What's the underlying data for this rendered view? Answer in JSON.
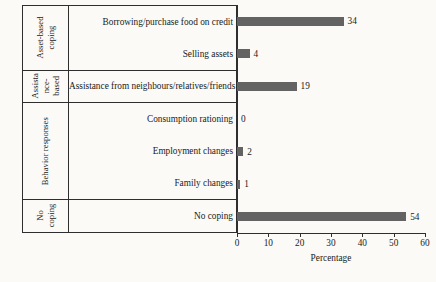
{
  "chart_data": {
    "type": "bar",
    "orientation": "horizontal",
    "title": "",
    "xlabel": "Percentage",
    "ylabel": "",
    "xlim": [
      0,
      60
    ],
    "xticks": [
      0,
      10,
      20,
      30,
      40,
      50,
      60
    ],
    "grid": false,
    "legend": null,
    "bar_color": "#636363",
    "categories": [
      "Borrowing/purchase food on credit",
      "Selling assets",
      "Assistance from neighbours/relatives/friends",
      "Consumption rationing",
      "Employment changes",
      "Family changes",
      "No coping"
    ],
    "values": [
      34,
      4,
      19,
      0,
      2,
      1,
      54
    ],
    "value_labels": [
      "34",
      "4",
      "19",
      "0",
      "2",
      "1",
      "54"
    ],
    "groups": [
      {
        "name": "Asset-based coping",
        "name_lines": [
          "Asset-based",
          "coping"
        ],
        "categories": [
          "Borrowing/purchase food on credit",
          "Selling assets"
        ],
        "values": [
          34,
          4
        ]
      },
      {
        "name": "Assistance-based",
        "name_lines": [
          "Assista",
          "nce-",
          "based"
        ],
        "categories": [
          "Assistance from neighbours/relatives/friends"
        ],
        "values": [
          19
        ]
      },
      {
        "name": "Behavior responses",
        "name_lines": [
          "Behavior responses"
        ],
        "categories": [
          "Consumption rationing",
          "Employment changes",
          "Family changes"
        ],
        "values": [
          0,
          2,
          1
        ]
      },
      {
        "name": "No coping",
        "name_lines": [
          "No",
          "coping"
        ],
        "categories": [
          "No coping"
        ],
        "values": [
          54
        ]
      }
    ]
  },
  "axis": {
    "ticks": [
      {
        "value": 0,
        "label": "0"
      },
      {
        "value": 10,
        "label": "10"
      },
      {
        "value": 20,
        "label": "20"
      },
      {
        "value": 30,
        "label": "30"
      },
      {
        "value": 40,
        "label": "40"
      },
      {
        "value": 50,
        "label": "50"
      },
      {
        "value": 60,
        "label": "60"
      }
    ],
    "title": "Percentage"
  },
  "groups": [
    {
      "lines": [
        "Asset-based",
        "coping"
      ],
      "rows": [
        {
          "label": "Borrowing/purchase food on credit",
          "value": 34,
          "value_label": "34"
        },
        {
          "label": "Selling assets",
          "value": 4,
          "value_label": "4"
        }
      ]
    },
    {
      "lines": [
        "Assista",
        "nce-",
        "based"
      ],
      "rows": [
        {
          "label": "Assistance from neighbours/relatives/friends",
          "value": 19,
          "value_label": "19"
        }
      ]
    },
    {
      "lines": [
        "Behavior responses"
      ],
      "rows": [
        {
          "label": "Consumption rationing",
          "value": 0,
          "value_label": "0"
        },
        {
          "label": "Employment changes",
          "value": 2,
          "value_label": "2"
        },
        {
          "label": "Family changes",
          "value": 1,
          "value_label": "1"
        }
      ]
    },
    {
      "lines": [
        "No coping"
      ],
      "lines_split": [
        "No",
        "coping"
      ],
      "rows": [
        {
          "label": "No coping",
          "value": 54,
          "value_label": "54"
        }
      ]
    }
  ]
}
